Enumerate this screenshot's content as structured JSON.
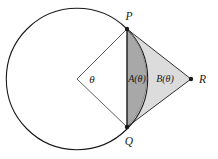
{
  "figure": {
    "type": "geometry-diagram",
    "background_color": "#ffffff",
    "stroke_color": "#1a1a1a",
    "segment_fill": "#a8a8a8",
    "triangle_fill": "#dcdcdc",
    "circle": {
      "center_x": 77,
      "center_y": 79,
      "radius": 70.7,
      "stroke_width": 1.1
    },
    "points": [
      {
        "name": "P",
        "label": "P",
        "x": 127,
        "y": 29,
        "label_x": 129,
        "label_y": 20,
        "dot_r": 2.2
      },
      {
        "name": "Q",
        "label": "Q",
        "x": 127,
        "y": 127,
        "label_x": 129,
        "label_y": 145,
        "dot_r": 2.2
      },
      {
        "name": "R",
        "label": "R",
        "x": 191,
        "y": 79,
        "label_x": 199,
        "label_y": 83,
        "dot_r": 2.2
      },
      {
        "name": "O",
        "label": "",
        "x": 77,
        "y": 79,
        "label_x": 0,
        "label_y": 0,
        "dot_r": 0
      }
    ],
    "angle_label": {
      "name": "theta",
      "text": "θ",
      "x": 92,
      "y": 83
    },
    "region_labels": [
      {
        "name": "A",
        "text": "A(θ)",
        "x": 137,
        "y": 82
      },
      {
        "name": "B",
        "text": "B(θ)",
        "x": 165,
        "y": 82
      }
    ],
    "lines": [
      {
        "name": "radius-OP",
        "x1": 77,
        "y1": 79,
        "x2": 127,
        "y2": 29
      },
      {
        "name": "radius-OQ",
        "x1": 77,
        "y1": 79,
        "x2": 127,
        "y2": 127
      },
      {
        "name": "chord-PQ",
        "x1": 127,
        "y1": 29,
        "x2": 127,
        "y2": 127
      },
      {
        "name": "side-PR",
        "x1": 127,
        "y1": 29,
        "x2": 191,
        "y2": 79
      },
      {
        "name": "side-QR",
        "x1": 127,
        "y1": 127,
        "x2": 191,
        "y2": 79
      }
    ]
  }
}
